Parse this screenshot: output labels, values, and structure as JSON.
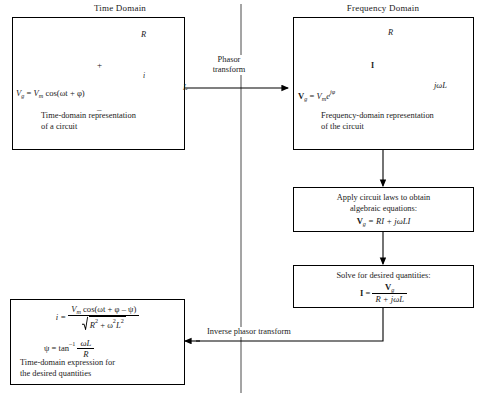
{
  "titles": {
    "left": "Time Domain",
    "right": "Frequency Domain"
  },
  "boxes": {
    "time_circuit": {
      "caption_line1": "Time-domain representation",
      "caption_line2": "of a circuit",
      "source_eq": "Vg = Vm cos(ωt + φ)",
      "source_lhs": "V",
      "source_lhs_sub": "g",
      "source_eq_rhs_v": "V",
      "source_eq_rhs_sub": "m",
      "source_eq_rhs_rest": "cos(ωt + φ)",
      "resistor_label": "R",
      "inductor_label": "L",
      "current_label": "i",
      "plus_sign": "+",
      "minus_sign": "–",
      "source_symbol": "~"
    },
    "freq_circuit": {
      "caption_line1": "Frequency-domain representation",
      "caption_line2": "of the circuit",
      "source_lhs": "V",
      "source_lhs_sub": "g",
      "source_eq_rhs_v": "V",
      "source_eq_rhs_sub": "m",
      "source_eq_exp_base": "e",
      "source_eq_exp": "jφ",
      "resistor_label": "R",
      "inductor_label": "jωL",
      "current_label": "I",
      "source_symbol": "~"
    },
    "apply_laws": {
      "line1": "Apply circuit laws to obtain",
      "line2": "algebraic equations:",
      "equation_lhs": "V",
      "equation_lhs_sub": "g",
      "equation_rhs": "= RI + jωLI"
    },
    "solve": {
      "line1": "Solve for desired quantities:",
      "equation_lhs": "I =",
      "numerator": "V",
      "numerator_sub": "g",
      "denominator": "R + jωL"
    },
    "inverse_result": {
      "eq1_lhs": "i =",
      "eq1_num_v": "V",
      "eq1_num_sub": "m",
      "eq1_num_rest": "cos(ωt + φ – ψ)",
      "eq1_den_r": "R",
      "eq1_den_r_sup": "2",
      "eq1_den_mid": "+ ω",
      "eq1_den_w_sup": "2",
      "eq1_den_l": "L",
      "eq1_den_l_sup": "2",
      "eq2_lhs": "ψ = tan",
      "eq2_sup": "–1",
      "eq2_num": "ωL",
      "eq2_den": "R",
      "caption_line1": "Time-domain expression for",
      "caption_line2": "the desired quantities"
    }
  },
  "arrows": {
    "phasor_transform_line1": "Phasor",
    "phasor_transform_line2": "transform",
    "inverse_phasor_transform": "Inverse phasor transform"
  },
  "colors": {
    "line": "#000000",
    "background": "#ffffff",
    "text": "#1a1a1a"
  }
}
